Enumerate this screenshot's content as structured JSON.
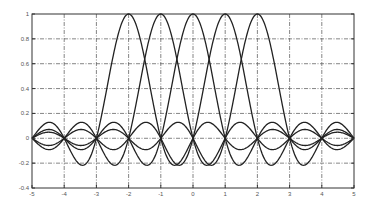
{
  "chart_data": {
    "type": "line",
    "title": "",
    "xlabel": "",
    "ylabel": "",
    "xlim": [
      -5,
      5
    ],
    "ylim": [
      -0.4,
      1
    ],
    "grid": true,
    "legend": null,
    "xticks": [
      -5,
      -4,
      -3,
      -2,
      -1,
      0,
      1,
      2,
      3,
      4,
      5
    ],
    "yticks": [
      -0.4,
      -0.2,
      0,
      0.2,
      0.4,
      0.6,
      0.8,
      1
    ],
    "xtick_labels": [
      "-5",
      "-4",
      "-3",
      "-2",
      "-1",
      "0",
      "1",
      "2",
      "3",
      "4",
      "5"
    ],
    "ytick_labels": [
      "-0.4",
      "-0.2",
      "0",
      "0.2",
      "0.4",
      "0.6",
      "0.8",
      "1"
    ],
    "series": [
      {
        "name": "sinc(x+2)",
        "center": -2,
        "peak": 1
      },
      {
        "name": "sinc(x+1)",
        "center": -1,
        "peak": 1
      },
      {
        "name": "sinc(x)",
        "center": 0,
        "peak": 1
      },
      {
        "name": "sinc(x-1)",
        "center": 1,
        "peak": 1
      },
      {
        "name": "sinc(x-2)",
        "center": 2,
        "peak": 1
      }
    ],
    "color": "#222222"
  }
}
